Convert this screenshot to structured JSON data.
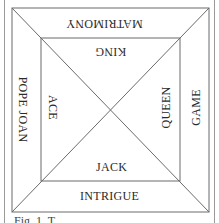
{
  "diagram": {
    "outer_segments": {
      "top": "MATRIMONY",
      "left": "POPE JOAN",
      "right": "GAME",
      "bottom": "INTRIGUE"
    },
    "inner_segments": {
      "top": "KING",
      "left": "ACE",
      "right": "QUEEN",
      "bottom": "JACK"
    },
    "caption": "Fig. 1. T"
  },
  "colors": {
    "line": "#6a6a6a",
    "frame": "#9a9a9a",
    "text": "#2a2a2a"
  }
}
